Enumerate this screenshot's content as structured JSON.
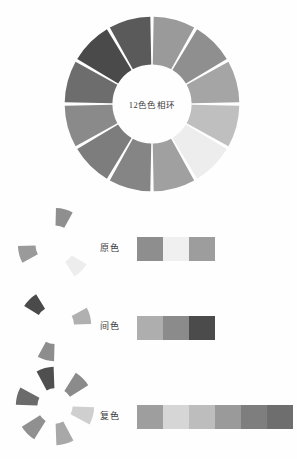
{
  "wheel": {
    "center_label": "12色色相环",
    "segment_count": 12,
    "segments": [
      {
        "index": 1,
        "position_oclock": 12,
        "color": "#9a9a9a"
      },
      {
        "index": 2,
        "position_oclock": 1,
        "color": "#8f8f8f"
      },
      {
        "index": 3,
        "position_oclock": 2,
        "color": "#a5a5a5"
      },
      {
        "index": 4,
        "position_oclock": 3,
        "color": "#bfbfbf"
      },
      {
        "index": 5,
        "position_oclock": 4,
        "color": "#ededed"
      },
      {
        "index": 6,
        "position_oclock": 5,
        "color": "#a0a0a0"
      },
      {
        "index": 7,
        "position_oclock": 6,
        "color": "#858585"
      },
      {
        "index": 8,
        "position_oclock": 7,
        "color": "#7d7d7d"
      },
      {
        "index": 9,
        "position_oclock": 8,
        "color": "#8a8a8a"
      },
      {
        "index": 10,
        "position_oclock": 9,
        "color": "#6d6d6d"
      },
      {
        "index": 11,
        "position_oclock": 10,
        "color": "#4a4a4a"
      },
      {
        "index": 12,
        "position_oclock": 11,
        "color": "#5a5a5a"
      }
    ]
  },
  "rows": {
    "primary": {
      "label": "原色",
      "segment_indices": [
        1,
        5,
        9
      ],
      "segment_colors": [
        "#8f8f8f",
        "#ededed",
        "#9a9a9a"
      ],
      "swatches": [
        "#8e8e8e",
        "#f0f0f0",
        "#9d9d9d"
      ]
    },
    "secondary": {
      "label": "间色",
      "segment_indices": [
        11,
        3,
        7
      ],
      "segment_colors": [
        "#4a4a4a",
        "#b0b0b0",
        "#8d8d8d"
      ],
      "swatches": [
        "#aeaeae",
        "#8b8b8b",
        "#4b4b4b"
      ]
    },
    "tertiary": {
      "label": "复色",
      "segment_indices": [
        12,
        2,
        4,
        6,
        8,
        10
      ],
      "segment_colors": [
        "#4f4f4f",
        "#8b8b8b",
        "#cfcfcf",
        "#a8a8a8",
        "#909090",
        "#6b6b6b"
      ],
      "swatches": [
        "#9e9e9e",
        "#d6d6d6",
        "#bdbdbd",
        "#9a9a9a",
        "#7e7e7e",
        "#6e6e6e"
      ]
    }
  },
  "chart_data": {
    "type": "pie",
    "title": "12色色相环",
    "xlabel": "",
    "ylabel": "",
    "grid": false,
    "legend": "none",
    "categories": [
      "seg-1-12oclock",
      "seg-2-1oclock",
      "seg-3-2oclock",
      "seg-4-3oclock",
      "seg-5-4oclock",
      "seg-6-5oclock",
      "seg-7-6oclock",
      "seg-8-7oclock",
      "seg-9-8oclock",
      "seg-10-9oclock",
      "seg-11-10oclock",
      "seg-12-11oclock"
    ],
    "values": [
      30,
      30,
      30,
      30,
      30,
      30,
      30,
      30,
      30,
      30,
      30,
      30
    ],
    "colors": [
      "#9a9a9a",
      "#8f8f8f",
      "#a5a5a5",
      "#bfbfbf",
      "#ededed",
      "#a0a0a0",
      "#858585",
      "#7d7d7d",
      "#8a8a8a",
      "#6d6d6d",
      "#4a4a4a",
      "#5a5a5a"
    ],
    "annotations": [
      "原色",
      "间色",
      "复色"
    ]
  }
}
